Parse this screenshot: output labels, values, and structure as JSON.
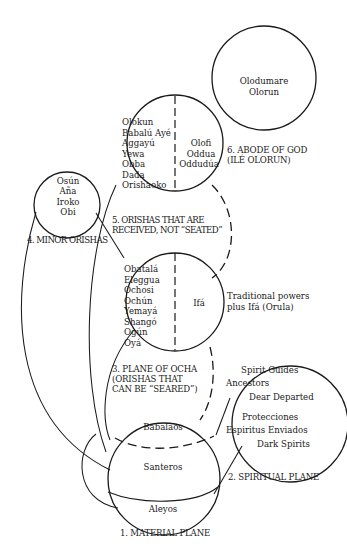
{
  "diagram": {
    "planes": [
      {
        "id": "material",
        "label": "1. MATERIAL PLANE",
        "members": [
          "Babalaos",
          "Santeros",
          "Aleyos"
        ]
      },
      {
        "id": "spiritual",
        "label": "2. SPIRITUAL PLANE",
        "members": [
          "Spirit Guides",
          "Ancestors",
          "Dear Departed",
          "Protecciones",
          "Espiritus Enviados",
          "Dark Spirits"
        ]
      },
      {
        "id": "ocha",
        "label_lines": [
          "3. PLANE OF OCHA",
          "(ORISHAS THAT",
          "CAN BE “SEARED”)"
        ],
        "members_left": [
          "Obatalá",
          "Eleggua",
          "Ochosi",
          "Ochún",
          "Yemayá",
          "Shangó",
          "Ogún",
          "Oyá"
        ],
        "members_right": [
          "Ifá"
        ],
        "side_note_lines": [
          "Traditional powers",
          "plus Ifá (Orula)"
        ]
      },
      {
        "id": "minor",
        "label": "4. MINOR ORISHAS",
        "members": [
          "Osún",
          "Aña",
          "Iroko",
          "Obi"
        ]
      },
      {
        "id": "received",
        "label_lines": [
          "5. ORISHAS THAT ARE",
          "RECEIVED, NOT “SEATED”"
        ],
        "members_left": [
          "Olokun",
          "Babalú Ayé",
          "Aggayú",
          "Yewa",
          "Obba",
          "Dada",
          "Orishaoko"
        ],
        "members_right": [
          "Olofi",
          "Oddua",
          "Oddudúa"
        ]
      },
      {
        "id": "god",
        "label_lines": [
          "6. ABODE OF GOD",
          "(ILÉ OLORUN)"
        ],
        "members": [
          "Olodumare",
          "Olorun"
        ]
      }
    ]
  }
}
